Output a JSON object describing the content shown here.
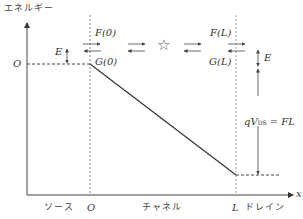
{
  "diagram": {
    "y_axis_label": "エネルギー",
    "x_axis_label": "x",
    "origin_label": "O",
    "x_ticks": [
      {
        "label": "ソース",
        "pos": "left"
      },
      {
        "label": "O",
        "pos": "0"
      },
      {
        "label": "チャネル",
        "pos": "middle"
      },
      {
        "label": "L",
        "pos": "L"
      },
      {
        "label": "ドレイン",
        "pos": "right"
      }
    ],
    "labels": {
      "F0": "F(0)",
      "G0": "G(0)",
      "FL": "F(L)",
      "GL": "G(L)",
      "E_left": "E",
      "E_right": "E",
      "star": "☆",
      "qv_prefix": "qV",
      "qv_sub": "DS",
      "qv_suffix": " = FL"
    },
    "source_labels": {
      "source": "ソース",
      "zero": "O",
      "channel": "チャネル",
      "L": "L",
      "drain": "ドレイン"
    }
  }
}
